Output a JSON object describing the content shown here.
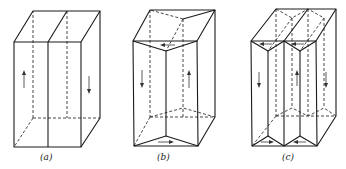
{
  "figure": {
    "panels": [
      {
        "id": "a",
        "label": "(a)",
        "description": "Rectangular prism divided into two domains by a vertical plane; left domain arrow up, right domain arrow down"
      },
      {
        "id": "b",
        "label": "(b)",
        "description": "Prism with closure domains: two triangular-prism domains at top and bottom; left arrow down, right arrow up, top arrow left, bottom arrow right"
      },
      {
        "id": "c",
        "label": "(c)",
        "description": "Prism with three vertical domains and four triangular closure domains; arrows alternate down, up, down with horizontal closure arrows"
      }
    ],
    "colors": {
      "line": "#1a1a1a",
      "background": "#ffffff"
    }
  }
}
